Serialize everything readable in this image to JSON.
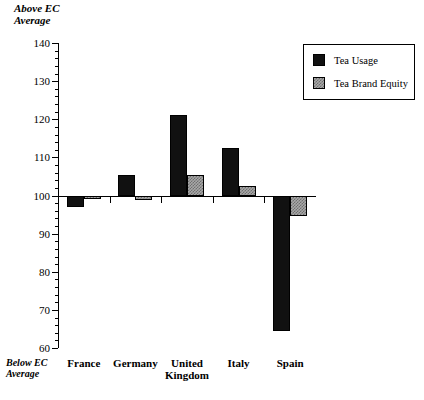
{
  "axis_captions": {
    "above": "Above EC\nAverage",
    "below": "Below EC\nAverage"
  },
  "legend": {
    "items": [
      {
        "label": "Tea Usage",
        "swatch": "black-solid-swatch",
        "color": "#111111"
      },
      {
        "label": "Tea Brand Equity",
        "swatch": "gray-checkered-swatch",
        "color": "#a8a8a8"
      }
    ]
  },
  "chart_data": {
    "type": "bar",
    "title": "",
    "subtitle": "",
    "xlabel": "",
    "ylabel": "",
    "categories": [
      "France",
      "Germany",
      "United\nKingdom",
      "Italy",
      "Spain"
    ],
    "series": [
      {
        "name": "Tea Usage",
        "values": [
          97,
          105.5,
          121,
          112.5,
          64.5
        ]
      },
      {
        "name": "Tea Brand Equity",
        "values": [
          99,
          98.8,
          105.5,
          102.5,
          94.5
        ]
      }
    ],
    "baseline": 100,
    "ylim": [
      60,
      140
    ],
    "ytick_major": [
      60,
      70,
      80,
      90,
      100,
      110,
      120,
      130,
      140
    ],
    "ytick_minor_step": 2,
    "ytick_labels": [
      "60",
      "70",
      "80",
      "90",
      "100",
      "110",
      "120",
      "130",
      "140"
    ],
    "grid": false,
    "legend_position": "top-right",
    "annotations": [
      "Above EC Average",
      "Below EC Average"
    ]
  }
}
